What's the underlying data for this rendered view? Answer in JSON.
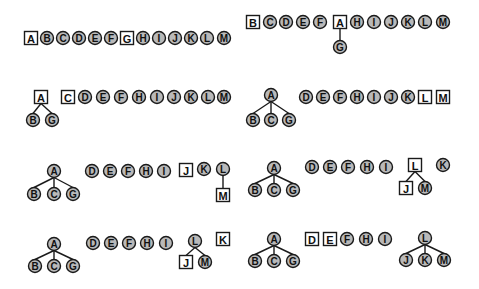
{
  "diagram": {
    "title": "",
    "colors": {
      "circle_fill": "#b9b9b9",
      "stroke": "#1a1a1a",
      "square_fill": "#ffffff"
    },
    "node_size": 13,
    "panels": [
      {
        "id": "p1",
        "nodes": [
          {
            "label": "A",
            "shape": "square",
            "x": 31,
            "y": 38
          },
          {
            "label": "B",
            "shape": "circle",
            "x": 47,
            "y": 38
          },
          {
            "label": "C",
            "shape": "circle",
            "x": 63,
            "y": 38
          },
          {
            "label": "D",
            "shape": "circle",
            "x": 79,
            "y": 38
          },
          {
            "label": "E",
            "shape": "circle",
            "x": 95,
            "y": 38
          },
          {
            "label": "F",
            "shape": "circle",
            "x": 111,
            "y": 38
          },
          {
            "label": "G",
            "shape": "square",
            "x": 127,
            "y": 38
          },
          {
            "label": "H",
            "shape": "circle",
            "x": 143,
            "y": 38
          },
          {
            "label": "I",
            "shape": "circle",
            "x": 159,
            "y": 38
          },
          {
            "label": "J",
            "shape": "circle",
            "x": 175,
            "y": 38
          },
          {
            "label": "K",
            "shape": "circle",
            "x": 191,
            "y": 38
          },
          {
            "label": "L",
            "shape": "circle",
            "x": 207,
            "y": 38
          },
          {
            "label": "M",
            "shape": "circle",
            "x": 224,
            "y": 38
          }
        ],
        "edges": []
      },
      {
        "id": "p2",
        "nodes": [
          {
            "label": "B",
            "shape": "square",
            "x": 253,
            "y": 22
          },
          {
            "label": "C",
            "shape": "circle",
            "x": 270,
            "y": 22
          },
          {
            "label": "D",
            "shape": "circle",
            "x": 286,
            "y": 22
          },
          {
            "label": "E",
            "shape": "circle",
            "x": 303,
            "y": 22
          },
          {
            "label": "F",
            "shape": "circle",
            "x": 320,
            "y": 22
          },
          {
            "label": "A",
            "shape": "square",
            "x": 340,
            "y": 22
          },
          {
            "label": "H",
            "shape": "circle",
            "x": 357,
            "y": 22
          },
          {
            "label": "I",
            "shape": "circle",
            "x": 374,
            "y": 22
          },
          {
            "label": "J",
            "shape": "circle",
            "x": 391,
            "y": 22
          },
          {
            "label": "K",
            "shape": "circle",
            "x": 408,
            "y": 22
          },
          {
            "label": "L",
            "shape": "circle",
            "x": 425,
            "y": 22
          },
          {
            "label": "M",
            "shape": "circle",
            "x": 443,
            "y": 22
          },
          {
            "label": "G",
            "shape": "circle",
            "x": 340,
            "y": 47
          }
        ],
        "edges": [
          [
            "A",
            "G"
          ]
        ]
      },
      {
        "id": "p3",
        "nodes": [
          {
            "label": "A",
            "shape": "square",
            "x": 41,
            "y": 97
          },
          {
            "label": "B",
            "shape": "circle",
            "x": 33,
            "y": 120
          },
          {
            "label": "G",
            "shape": "circle",
            "x": 52,
            "y": 120
          },
          {
            "label": "C",
            "shape": "square",
            "x": 68,
            "y": 97
          },
          {
            "label": "D",
            "shape": "circle",
            "x": 85,
            "y": 97
          },
          {
            "label": "E",
            "shape": "circle",
            "x": 103,
            "y": 97
          },
          {
            "label": "F",
            "shape": "circle",
            "x": 121,
            "y": 97
          },
          {
            "label": "H",
            "shape": "circle",
            "x": 139,
            "y": 97
          },
          {
            "label": "I",
            "shape": "circle",
            "x": 157,
            "y": 97
          },
          {
            "label": "J",
            "shape": "circle",
            "x": 174,
            "y": 97
          },
          {
            "label": "K",
            "shape": "circle",
            "x": 191,
            "y": 97
          },
          {
            "label": "L",
            "shape": "circle",
            "x": 208,
            "y": 97
          },
          {
            "label": "M",
            "shape": "circle",
            "x": 224,
            "y": 97
          }
        ],
        "edges": [
          [
            "A",
            "B"
          ],
          [
            "A",
            "G"
          ]
        ]
      },
      {
        "id": "p4",
        "nodes": [
          {
            "label": "A",
            "shape": "circle",
            "x": 271,
            "y": 95
          },
          {
            "label": "B",
            "shape": "circle",
            "x": 253,
            "y": 120
          },
          {
            "label": "C",
            "shape": "circle",
            "x": 271,
            "y": 120
          },
          {
            "label": "G",
            "shape": "circle",
            "x": 289,
            "y": 120
          },
          {
            "label": "D",
            "shape": "circle",
            "x": 306,
            "y": 97
          },
          {
            "label": "E",
            "shape": "circle",
            "x": 323,
            "y": 97
          },
          {
            "label": "F",
            "shape": "circle",
            "x": 340,
            "y": 97
          },
          {
            "label": "H",
            "shape": "circle",
            "x": 357,
            "y": 97
          },
          {
            "label": "I",
            "shape": "circle",
            "x": 374,
            "y": 97
          },
          {
            "label": "J",
            "shape": "circle",
            "x": 391,
            "y": 97
          },
          {
            "label": "K",
            "shape": "circle",
            "x": 408,
            "y": 97
          },
          {
            "label": "L",
            "shape": "square",
            "x": 425,
            "y": 97
          },
          {
            "label": "M",
            "shape": "square",
            "x": 443,
            "y": 97
          }
        ],
        "edges": [
          [
            "A",
            "B"
          ],
          [
            "A",
            "C"
          ],
          [
            "A",
            "G"
          ]
        ]
      },
      {
        "id": "p5",
        "nodes": [
          {
            "label": "A",
            "shape": "circle",
            "x": 54,
            "y": 171
          },
          {
            "label": "B",
            "shape": "circle",
            "x": 34,
            "y": 194
          },
          {
            "label": "C",
            "shape": "circle",
            "x": 54,
            "y": 194
          },
          {
            "label": "G",
            "shape": "circle",
            "x": 73,
            "y": 194
          },
          {
            "label": "D",
            "shape": "circle",
            "x": 92,
            "y": 171
          },
          {
            "label": "E",
            "shape": "circle",
            "x": 110,
            "y": 171
          },
          {
            "label": "F",
            "shape": "circle",
            "x": 128,
            "y": 171
          },
          {
            "label": "H",
            "shape": "circle",
            "x": 146,
            "y": 171
          },
          {
            "label": "I",
            "shape": "circle",
            "x": 164,
            "y": 171
          },
          {
            "label": "J",
            "shape": "square",
            "x": 186,
            "y": 170
          },
          {
            "label": "K",
            "shape": "circle",
            "x": 204,
            "y": 169
          },
          {
            "label": "L",
            "shape": "circle",
            "x": 223,
            "y": 169
          },
          {
            "label": "M",
            "shape": "square",
            "x": 223,
            "y": 195
          }
        ],
        "edges": [
          [
            "A",
            "B"
          ],
          [
            "A",
            "C"
          ],
          [
            "A",
            "G"
          ],
          [
            "L",
            "M"
          ]
        ]
      },
      {
        "id": "p6",
        "nodes": [
          {
            "label": "A",
            "shape": "circle",
            "x": 274,
            "y": 168
          },
          {
            "label": "B",
            "shape": "circle",
            "x": 255,
            "y": 190
          },
          {
            "label": "C",
            "shape": "circle",
            "x": 274,
            "y": 190
          },
          {
            "label": "G",
            "shape": "circle",
            "x": 293,
            "y": 190
          },
          {
            "label": "D",
            "shape": "circle",
            "x": 312,
            "y": 167
          },
          {
            "label": "E",
            "shape": "circle",
            "x": 330,
            "y": 167
          },
          {
            "label": "F",
            "shape": "circle",
            "x": 348,
            "y": 167
          },
          {
            "label": "H",
            "shape": "circle",
            "x": 367,
            "y": 167
          },
          {
            "label": "I",
            "shape": "circle",
            "x": 386,
            "y": 167
          },
          {
            "label": "L",
            "shape": "square",
            "x": 415,
            "y": 165
          },
          {
            "label": "K",
            "shape": "circle",
            "x": 443,
            "y": 165
          },
          {
            "label": "J",
            "shape": "square",
            "x": 406,
            "y": 188
          },
          {
            "label": "M",
            "shape": "circle",
            "x": 425,
            "y": 188
          }
        ],
        "edges": [
          [
            "A",
            "B"
          ],
          [
            "A",
            "C"
          ],
          [
            "A",
            "G"
          ],
          [
            "L",
            "J"
          ],
          [
            "L",
            "M"
          ]
        ]
      },
      {
        "id": "p7",
        "nodes": [
          {
            "label": "A",
            "shape": "circle",
            "x": 54,
            "y": 244
          },
          {
            "label": "B",
            "shape": "circle",
            "x": 35,
            "y": 266
          },
          {
            "label": "C",
            "shape": "circle",
            "x": 54,
            "y": 266
          },
          {
            "label": "G",
            "shape": "circle",
            "x": 73,
            "y": 266
          },
          {
            "label": "D",
            "shape": "circle",
            "x": 93,
            "y": 243
          },
          {
            "label": "E",
            "shape": "circle",
            "x": 111,
            "y": 243
          },
          {
            "label": "F",
            "shape": "circle",
            "x": 129,
            "y": 243
          },
          {
            "label": "H",
            "shape": "circle",
            "x": 147,
            "y": 243
          },
          {
            "label": "I",
            "shape": "circle",
            "x": 166,
            "y": 243
          },
          {
            "label": "L",
            "shape": "circle",
            "x": 195,
            "y": 241
          },
          {
            "label": "K",
            "shape": "square",
            "x": 223,
            "y": 239
          },
          {
            "label": "J",
            "shape": "square",
            "x": 186,
            "y": 262
          },
          {
            "label": "M",
            "shape": "circle",
            "x": 205,
            "y": 262
          }
        ],
        "edges": [
          [
            "A",
            "B"
          ],
          [
            "A",
            "C"
          ],
          [
            "A",
            "G"
          ],
          [
            "L",
            "J"
          ],
          [
            "L",
            "M"
          ]
        ]
      },
      {
        "id": "p8",
        "nodes": [
          {
            "label": "A",
            "shape": "circle",
            "x": 274,
            "y": 239
          },
          {
            "label": "B",
            "shape": "circle",
            "x": 255,
            "y": 261
          },
          {
            "label": "C",
            "shape": "circle",
            "x": 274,
            "y": 261
          },
          {
            "label": "G",
            "shape": "circle",
            "x": 293,
            "y": 261
          },
          {
            "label": "D",
            "shape": "square",
            "x": 312,
            "y": 239
          },
          {
            "label": "E",
            "shape": "square",
            "x": 330,
            "y": 239
          },
          {
            "label": "F",
            "shape": "circle",
            "x": 347,
            "y": 239
          },
          {
            "label": "H",
            "shape": "circle",
            "x": 366,
            "y": 239
          },
          {
            "label": "I",
            "shape": "circle",
            "x": 385,
            "y": 239
          },
          {
            "label": "L",
            "shape": "circle",
            "x": 425,
            "y": 238
          },
          {
            "label": "J",
            "shape": "circle",
            "x": 406,
            "y": 260
          },
          {
            "label": "K",
            "shape": "circle",
            "x": 425,
            "y": 260
          },
          {
            "label": "M",
            "shape": "circle",
            "x": 444,
            "y": 260
          }
        ],
        "edges": [
          [
            "A",
            "B"
          ],
          [
            "A",
            "C"
          ],
          [
            "A",
            "G"
          ],
          [
            "L",
            "J"
          ],
          [
            "L",
            "K"
          ],
          [
            "L",
            "M"
          ]
        ]
      }
    ]
  }
}
